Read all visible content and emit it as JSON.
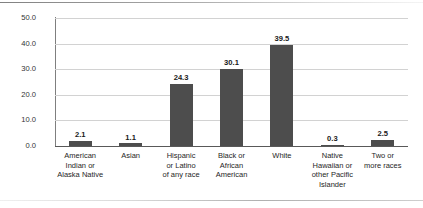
{
  "chart_data": {
    "type": "bar",
    "title": "",
    "xlabel": "",
    "ylabel": "Percentage of students",
    "categories": [
      "American Indian or Alaska Native",
      "Asian",
      "Hispanic or Latino of any race",
      "Black or African American",
      "White",
      "Native Hawaiian or other Pacific Islander",
      "Two or more races"
    ],
    "category_lines": [
      [
        "American",
        "Indian or",
        "Alaska Native"
      ],
      [
        "Asian"
      ],
      [
        "Hispanic",
        "or Latino",
        "of any race"
      ],
      [
        "Black or",
        "African",
        "American"
      ],
      [
        "White"
      ],
      [
        "Native",
        "Hawaiian or",
        "other Pacific",
        "Islander"
      ],
      [
        "Two or",
        "more races"
      ]
    ],
    "values": [
      2.1,
      1.1,
      24.3,
      30.1,
      39.5,
      0.3,
      2.5
    ],
    "value_labels": [
      "2.1",
      "1.1",
      "24.3",
      "30.1",
      "39.5",
      "0.3",
      "2.5"
    ],
    "ylim": [
      0.0,
      50.0
    ],
    "ytick_labels": [
      "0.0",
      "10.0",
      "20.0",
      "30.0",
      "40.0",
      "50.0"
    ],
    "yticks": [
      0.0,
      10.0,
      20.0,
      30.0,
      40.0,
      50.0
    ],
    "grid": "horizontal",
    "legend": "none",
    "bar_color": "#4d4d4d",
    "gridline_color": "#d2d2d2",
    "axis_color": "#595959",
    "background": "#ffffff"
  }
}
